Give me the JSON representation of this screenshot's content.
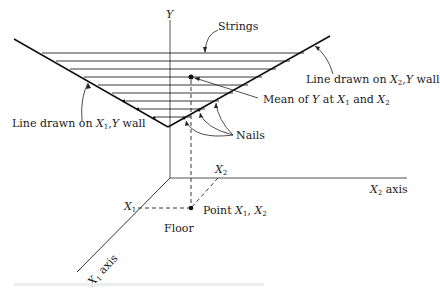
{
  "diagram": {
    "axes": {
      "y_label": "Y",
      "x1_axis_label_var": "X",
      "x1_axis_label_sub": "1",
      "x1_axis_label_word": " axis",
      "x2_axis_label_var": "X",
      "x2_axis_label_sub": "2",
      "x2_axis_label_word": " axis"
    },
    "labels": {
      "strings": "Strings",
      "line_x1y_prefix": "Line drawn on ",
      "line_x1y_var": "X",
      "line_x1y_sub": "1",
      "line_x1y_suffix_var": ",Y",
      "line_x1y_suffix": " wall",
      "line_x2y_prefix": "Line drawn on ",
      "line_x2y_var": "X",
      "line_x2y_sub": "2",
      "line_x2y_suffix_var": ",Y",
      "line_x2y_suffix": " wall",
      "mean_prefix": "Mean of ",
      "mean_y": "Y",
      "mean_at": " at ",
      "mean_x": "X",
      "mean_sub1": "1",
      "mean_and": " and ",
      "mean_sub2": "2",
      "nails": "Nails",
      "x1_tick_var": "X",
      "x1_tick_sub": "1",
      "x2_tick_var": "X",
      "x2_tick_sub": "2",
      "point_prefix": "Point ",
      "point_var": "X",
      "point_sub1": "1",
      "point_sep": ", ",
      "point_sub2": "2",
      "floor": "Floor"
    },
    "colors": {
      "ink": "#1a1a1a",
      "axis": "#555555",
      "background": "#ffffff"
    }
  }
}
